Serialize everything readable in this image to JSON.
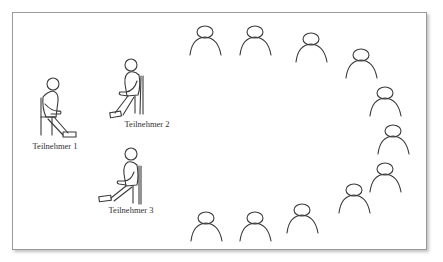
{
  "diagram": {
    "type": "seating-arrangement",
    "stroke_color": "#3a3a3a",
    "frame_color": "#9a9a9a",
    "participants": [
      {
        "label": "Teilnehmer 1",
        "x": 55,
        "y": 141
      },
      {
        "label": "Teilnehmer 2",
        "x": 147,
        "y": 119
      },
      {
        "label": "Teilnehmer 3",
        "x": 131,
        "y": 205
      }
    ],
    "audience_icon": "person-bust-icon",
    "audience": [
      {
        "x": 205,
        "y": 32
      },
      {
        "x": 255,
        "y": 32
      },
      {
        "x": 311,
        "y": 39
      },
      {
        "x": 361,
        "y": 55
      },
      {
        "x": 385,
        "y": 93
      },
      {
        "x": 393,
        "y": 131
      },
      {
        "x": 385,
        "y": 169
      },
      {
        "x": 354,
        "y": 190
      },
      {
        "x": 302,
        "y": 210
      },
      {
        "x": 255,
        "y": 218
      },
      {
        "x": 206,
        "y": 218
      }
    ]
  }
}
